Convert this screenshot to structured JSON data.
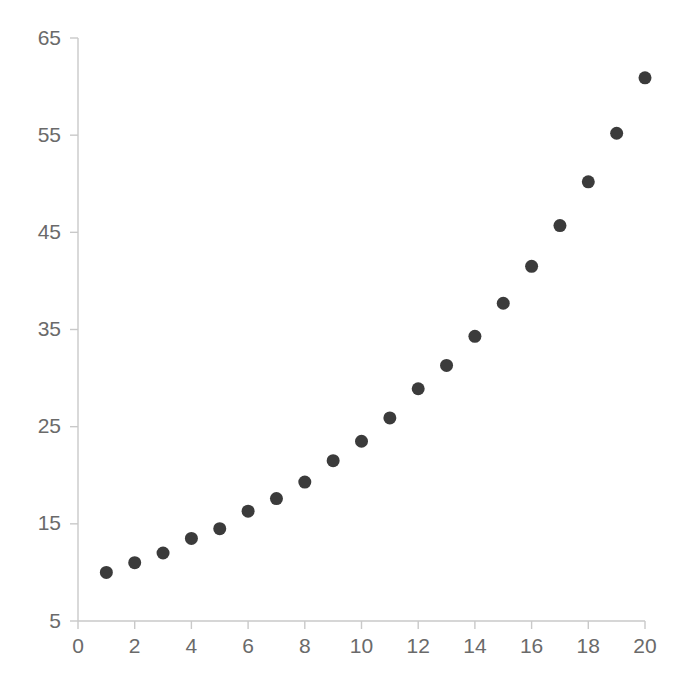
{
  "chart_data": {
    "type": "scatter",
    "title": "",
    "subtitle": "",
    "xlabel": "",
    "ylabel": "",
    "x": [
      1,
      2,
      3,
      4,
      5,
      6,
      7,
      8,
      9,
      10,
      11,
      12,
      13,
      14,
      15,
      16,
      17,
      18,
      19,
      20
    ],
    "values": [
      10.0,
      11.0,
      12.0,
      13.5,
      14.5,
      16.3,
      17.6,
      19.3,
      21.5,
      23.5,
      25.9,
      28.9,
      31.3,
      34.3,
      37.7,
      41.5,
      45.7,
      50.2,
      55.2,
      60.9
    ],
    "series": [
      {
        "name": "series-1",
        "marker": "circle",
        "color": "#3b3b3b",
        "marker_size": 13,
        "x": [
          1,
          2,
          3,
          4,
          5,
          6,
          7,
          8,
          9,
          10,
          11,
          12,
          13,
          14,
          15,
          16,
          17,
          18,
          19,
          20
        ],
        "y": [
          10.0,
          11.0,
          12.0,
          13.5,
          14.5,
          16.3,
          17.6,
          19.3,
          21.5,
          23.5,
          25.9,
          28.9,
          31.3,
          34.3,
          37.7,
          41.5,
          45.7,
          50.2,
          55.2,
          60.9
        ]
      }
    ],
    "xlim": [
      0,
      20
    ],
    "ylim": [
      5,
      65
    ],
    "x_ticks": [
      0,
      2,
      4,
      6,
      8,
      10,
      12,
      14,
      16,
      18,
      20
    ],
    "x_tick_labels": [
      "0",
      "2",
      "4",
      "6",
      "8",
      "10",
      "12",
      "14",
      "16",
      "18",
      "20"
    ],
    "y_ticks": [
      5,
      15,
      25,
      35,
      45,
      55,
      65
    ],
    "y_tick_labels": [
      "5",
      "15",
      "25",
      "35",
      "45",
      "55",
      "65"
    ],
    "grid": false,
    "legend": "none",
    "axis_color": "#c9c9c9",
    "tick_label_color": "#6a6a6a",
    "background_color": "#ffffff"
  }
}
